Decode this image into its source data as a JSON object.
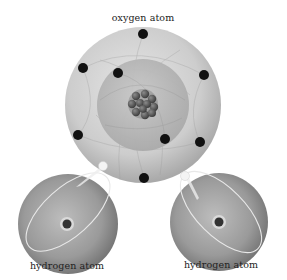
{
  "diagram": {
    "labels": {
      "oxygen": "oxygen atom",
      "hydrogen_left": "hydrogen atom",
      "hydrogen_right": "hydrogen atom"
    },
    "oxygen_atom": {
      "center": [
        143,
        105
      ],
      "outer_radius": 78,
      "inner_shell_radius": 46,
      "nucleus_radius": 16,
      "outer_electrons": [
        [
          143,
          34
        ],
        [
          83,
          68
        ],
        [
          204,
          75
        ],
        [
          78,
          135
        ],
        [
          200,
          142
        ],
        [
          144,
          178
        ]
      ],
      "inner_electrons": [
        [
          118,
          73
        ],
        [
          165,
          139
        ]
      ],
      "electron_count": 8
    },
    "hydrogen_atoms": [
      {
        "side": "left",
        "center": [
          68,
          224
        ],
        "radius": 50,
        "nucleus": [
          67,
          224
        ],
        "electron": [
          103,
          165
        ]
      },
      {
        "side": "right",
        "center": [
          219,
          222
        ],
        "radius": 49,
        "nucleus": [
          219,
          222
        ],
        "electron": [
          184,
          175
        ]
      }
    ],
    "colors": {
      "background": "#ffffff",
      "oxygen_outer": "#c9c9c9",
      "oxygen_inner": "#b5b5b5",
      "nucleus": "#4a4a4a",
      "electron": "#111111",
      "hydrogen_body": "#9a9a9a",
      "hydrogen_electron": "#f2f2f2",
      "label_text": "#222222"
    }
  }
}
